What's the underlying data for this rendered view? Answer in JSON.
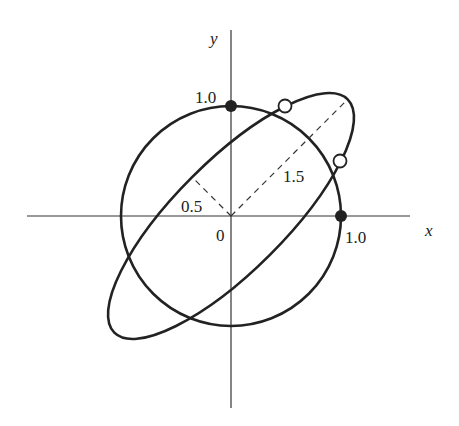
{
  "diagram": {
    "axes": {
      "x_label": "x",
      "y_label": "y",
      "origin_label": "0"
    },
    "labels": {
      "circle_top": "1.0",
      "circle_right": "1.0",
      "semi_major": "1.5",
      "semi_minor": "0.5"
    },
    "shapes": {
      "circle": {
        "radius": 1.0,
        "center": [
          0,
          0
        ]
      },
      "ellipse": {
        "semi_major": 1.5,
        "semi_minor": 0.5,
        "rotation_deg": 45
      }
    },
    "points": {
      "filled": [
        [
          0,
          1.0
        ],
        [
          1.0,
          0
        ]
      ],
      "open_count": 2
    },
    "colors": {
      "stroke": "#222222",
      "background": "#ffffff"
    }
  }
}
